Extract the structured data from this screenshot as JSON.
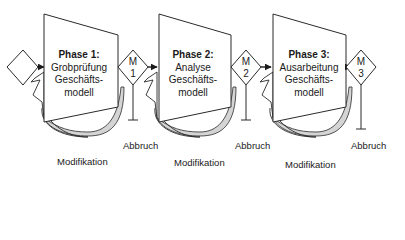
{
  "diagram": {
    "start_node": {
      "shape": "diamond"
    },
    "phases": [
      {
        "title": "Phase 1:",
        "lines": [
          "Grobprüfung",
          "Geschäfts-",
          "modell"
        ]
      },
      {
        "title": "Phase 2:",
        "lines": [
          "Analyse",
          "Geschäfts-",
          "modell"
        ]
      },
      {
        "title": "Phase 3:",
        "lines": [
          "Ausarbeitung",
          "Geschäfts-",
          "modell"
        ]
      }
    ],
    "milestones": [
      {
        "label_top": "M",
        "label_bottom": "1",
        "exit_label": "Abbruch"
      },
      {
        "label_top": "M",
        "label_bottom": "2",
        "exit_label": "Abbruch"
      },
      {
        "label_top": "M",
        "label_bottom": "3",
        "exit_label": "Abbruch"
      }
    ],
    "feedback_labels": [
      "Modifikation",
      "Modifikation",
      "Modifikation"
    ],
    "colors": {
      "line": "#2a2a2a",
      "arc_fill": "#d4d4d4",
      "background": "#ffffff"
    }
  }
}
